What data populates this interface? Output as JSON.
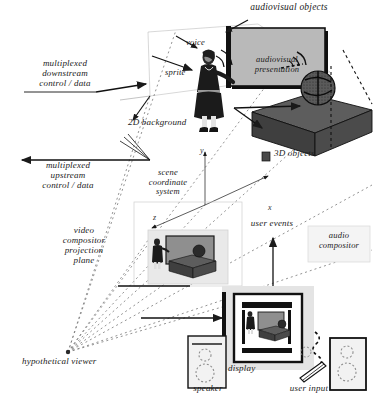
{
  "figure": {
    "kind": "technical-diagram",
    "title_text": "audiovisual objects",
    "background_color": "#ffffff",
    "ink_color": "#1a1a1a"
  },
  "labels": {
    "audiovisual_objects": "audiovisual objects",
    "voice": "voice",
    "sprite": "sprite",
    "audiovisual_presentation": "audiovisual\npresentation",
    "multiplexed_downstream": "multiplexed\ndownstream\ncontrol / data",
    "multiplexed_upstream": "multiplexed\nupstream\ncontrol / data",
    "background_2d": "2D background",
    "objects_3d": "3D objects",
    "scene_coordinate_system": "scene\ncoordinate\nsystem",
    "video_compositor": "video\ncompositor\nprojection\nplane",
    "audio_compositor": "audio\ncompositor",
    "user_events": "user events",
    "hypothetical_viewer": "hypothetical viewer",
    "display": "display",
    "speaker": "speaker",
    "user_input": "user input",
    "axis_x": "x",
    "axis_y": "y",
    "axis_z": "z"
  },
  "colors": {
    "screen_fill": "#b9b9b9",
    "table_fill": "#4e4e4e",
    "panel_fill": "#e6e6e6",
    "device_fill": "#f2f2f2",
    "line": "#1a1a1a",
    "dash": "#6e6e6e"
  },
  "scene_elements": {
    "projection_screen": "audiovisual presentation screen",
    "sprite_figure": "standing presenter sprite",
    "table_3d": "3D table object",
    "sphere_3d": "3D textured sphere object",
    "inset_scene": "composited projection-plane scene",
    "monitor": "display monitor showing composited scene",
    "speaker_box": "loudspeaker",
    "input_device": "user input device"
  }
}
